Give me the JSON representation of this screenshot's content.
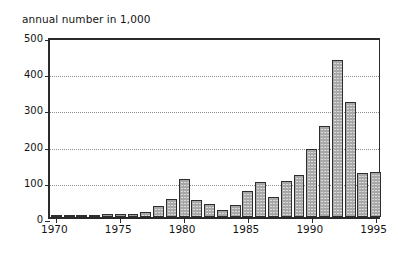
{
  "chart_data": {
    "type": "bar",
    "title": "annual number in 1,000",
    "xlabel": "",
    "ylabel": "annual number in 1,000",
    "ylim": [
      0,
      500
    ],
    "yticks": [
      0,
      100,
      200,
      300,
      400,
      500
    ],
    "xticks": [
      1970,
      1975,
      1980,
      1985,
      1990,
      1995
    ],
    "xlim": [
      1969.5,
      1995.5
    ],
    "grid": "horizontal-dotted",
    "legend": "none",
    "categories": [
      "1970",
      "1971",
      "1972",
      "1973",
      "1974",
      "1975",
      "1976",
      "1977",
      "1978",
      "1979",
      "1980",
      "1981",
      "1982",
      "1983",
      "1984",
      "1985",
      "1986",
      "1987",
      "1988",
      "1989",
      "1990",
      "1991",
      "1992",
      "1993",
      "1994",
      "1995"
    ],
    "values": [
      6,
      5,
      4,
      4,
      9,
      8,
      9,
      15,
      31,
      50,
      105,
      47,
      35,
      18,
      32,
      71,
      96,
      54,
      100,
      117,
      189,
      252,
      433,
      318,
      121,
      123
    ]
  },
  "axis": {
    "y_tick_labels": [
      "0",
      "100",
      "200",
      "300",
      "400",
      "500"
    ],
    "x_tick_labels": [
      "1970",
      "1975",
      "1980",
      "1985",
      "1990",
      "1995"
    ]
  },
  "colors": {
    "bar_fill": "#a8a8a8",
    "bar_border": "#2e2e2e",
    "axis": "#2b2b2b",
    "grid": "#8d8d8d",
    "text": "#141414",
    "background": "#ffffff"
  }
}
